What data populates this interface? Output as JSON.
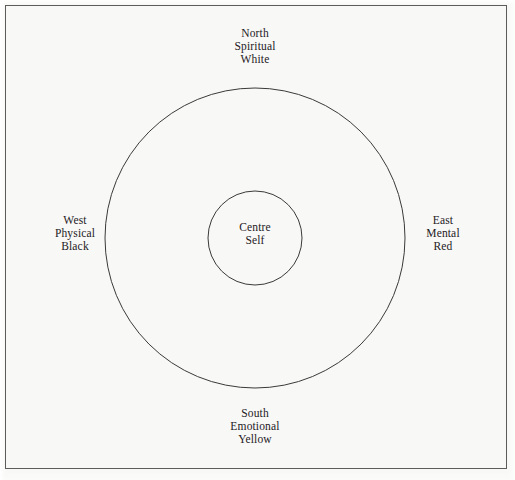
{
  "figure": {
    "background_color": "#f8f8f6",
    "frame": {
      "stroke_color": "#5c5c5c",
      "stroke_width": 1
    },
    "circles": {
      "stroke_color": "#3a3a3a",
      "fill": "none",
      "outer": {
        "cx": 255,
        "cy": 238,
        "r": 150,
        "stroke_width": 1
      },
      "inner": {
        "cx": 255,
        "cy": 238,
        "r": 47,
        "stroke_width": 1
      }
    },
    "text_color": "#24201e"
  },
  "labels": {
    "north": {
      "direction": "North",
      "aspect": "Spiritual",
      "color_name": "White"
    },
    "east": {
      "direction": "East",
      "aspect": "Mental",
      "color_name": "Red"
    },
    "south": {
      "direction": "South",
      "aspect": "Emotional",
      "color_name": "Yellow"
    },
    "west": {
      "direction": "West",
      "aspect": "Physical",
      "color_name": "Black"
    },
    "centre": {
      "position": "Centre",
      "aspect": "Self"
    }
  }
}
